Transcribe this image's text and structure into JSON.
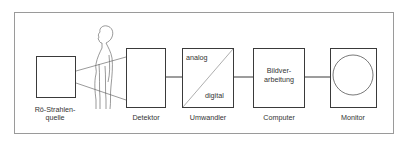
{
  "diagram": {
    "title": "",
    "blocks": [
      {
        "id": "source",
        "label_line1": "Rö-Strahlen-",
        "label_line2": "quelle"
      },
      {
        "id": "detector",
        "label": "Detektor"
      },
      {
        "id": "converter",
        "label": "Umwandler",
        "inner_top": "analog",
        "inner_bottom": "digital"
      },
      {
        "id": "computer",
        "label": "Computer",
        "inner_line1": "Bildver-",
        "inner_line2": "arbeitung"
      },
      {
        "id": "monitor",
        "label": "Monitor"
      }
    ],
    "connections": [
      {
        "from": "source",
        "to": "detector",
        "type": "x-ray beam through patient"
      },
      {
        "from": "detector",
        "to": "converter"
      },
      {
        "from": "converter",
        "to": "computer"
      },
      {
        "from": "computer",
        "to": "monitor"
      }
    ],
    "figure": "patient-silhouette",
    "colors": {
      "line": "#3a3a3a",
      "frame": "#9a9a9a",
      "background": "#ffffff"
    }
  }
}
